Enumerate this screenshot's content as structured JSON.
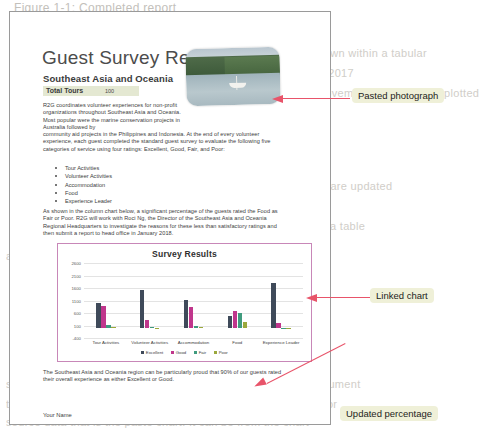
{
  "page": {
    "title": "Guest Survey Results",
    "subtitle": "Southeast Asia and Oceania",
    "total_tours_label": "Total Tours",
    "total_tours_value": "100",
    "paragraph_1": "R2G coordinates volunteer experiences for non-profit organizations throughout Southeast Asia and Oceania. Most popular were the marine conservation projects in Australia followed by",
    "paragraph_1b": "community aid projects in the Philippines and Indonesia. At the end of every volunteer experience, each guest completed the standard guest survey to evaluate the following five categories of service using four ratings: Excellent, Good, Fair, and Poor:",
    "bullets": [
      "Tour Activities",
      "Volunteer Activities",
      "Accommodation",
      "Food",
      "Experience Leader"
    ],
    "paragraph_2": "As shown in the column chart below, a significant percentage of the guests rated the Food as Fair or Poor. R2G will work with Roci Ng, the Director of the Southeast Asia and Oceania Regional Headquarters to investigate the reasons for these less than satisfactory ratings and then submit a report to head office in January 2018.",
    "paragraph_3": "The Southeast Asia and Oceania region can be particularly proud that 90% of our guests rated their overall experience as either Excellent or Good.",
    "percentage": "90%",
    "footer_name": "Your Name"
  },
  "chart_data": {
    "type": "bar",
    "title": "Survey Results",
    "xlabel": "",
    "ylabel": "",
    "ylim": [
      -400,
      2600
    ],
    "yticks": [
      2600,
      2100,
      1600,
      1100,
      600,
      100,
      -400
    ],
    "grid": true,
    "legend_position": "bottom",
    "categories": [
      "Tour Activities",
      "Volunteer Activities",
      "Accommodation",
      "Food",
      "Experience Leader"
    ],
    "series": [
      {
        "name": "Excellent",
        "color": "#3f4a5a",
        "values": [
          990,
          1520,
          1120,
          480,
          1790
        ]
      },
      {
        "name": "Good",
        "color": "#c0368c",
        "values": [
          900,
          330,
          830,
          700,
          200
        ]
      },
      {
        "name": "Fair",
        "color": "#3f9b7e",
        "values": [
          110,
          40,
          100,
          620,
          20
        ]
      },
      {
        "name": "Poor",
        "color": "#9aa83c",
        "values": [
          30,
          20,
          30,
          230,
          10
        ]
      }
    ]
  },
  "callouts": [
    {
      "label": "Pasted photograph"
    },
    {
      "label": "Linked chart"
    },
    {
      "label": "Updated percentage"
    }
  ],
  "background_text": {
    "heading": "Figure 1-1: Completed report",
    "lines": [
      "the reference sources and web code shown within a tabular",
      "summary to all the figures the data and entered as charted in 2017",
      "illustrated and the suggested improvements is listed and plotted",
      "report",
      "document a specific available by adding. Charts are updated",
      "a table",
      "and ways to click the chart in chart to work with a",
      "source, you can paste the chart in 'save' and linked. In the document",
      "the tabs to choose the best approach for each task. If the first or",
      "source data that is the paste chart. It can be from the chart"
    ]
  },
  "colors": {
    "callout_bg": "#eff0d8",
    "arrow": "#e8546a",
    "chart_border": "#c887b8",
    "highlight": "#e4e8d2"
  }
}
